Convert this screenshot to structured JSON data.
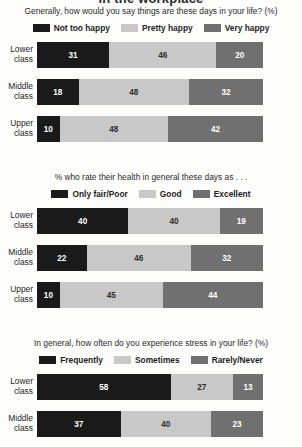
{
  "header": {
    "cut_title": "in the workplace"
  },
  "colors": {
    "cat1": "#1a1a1a",
    "cat2": "#c8c8c8",
    "cat3": "#707070",
    "background": "#fdfdfc",
    "text": "#1d1d1d"
  },
  "charts": [
    {
      "subtitle": "Generally, how would you say things are these days in your life? (%)",
      "legend": [
        "Not too happy",
        "Pretty happy",
        "Very happy"
      ],
      "rows": [
        {
          "label_line1": "Lower",
          "label_line2": "class",
          "values": [
            31,
            46,
            20
          ]
        },
        {
          "label_line1": "Middle",
          "label_line2": "class",
          "values": [
            18,
            48,
            32
          ]
        },
        {
          "label_line1": "Upper",
          "label_line2": "class",
          "values": [
            10,
            48,
            42
          ]
        }
      ]
    },
    {
      "subtitle": "% who rate their health in general these days as . . .",
      "legend": [
        "Only fair/Poor",
        "Good",
        "Excellent"
      ],
      "rows": [
        {
          "label_line1": "Lower",
          "label_line2": "class",
          "values": [
            40,
            40,
            19
          ]
        },
        {
          "label_line1": "Middle",
          "label_line2": "class",
          "values": [
            22,
            46,
            32
          ]
        },
        {
          "label_line1": "Upper",
          "label_line2": "class",
          "values": [
            10,
            45,
            44
          ]
        }
      ]
    },
    {
      "subtitle": "In general, how often do you experience stress in your life? (%)",
      "legend": [
        "Frequently",
        "Sometimes",
        "Rarely/Never"
      ],
      "rows": [
        {
          "label_line1": "Lower",
          "label_line2": "class",
          "values": [
            58,
            27,
            13
          ]
        },
        {
          "label_line1": "Middle",
          "label_line2": "class",
          "values": [
            37,
            40,
            23
          ]
        }
      ]
    }
  ],
  "chart_data": [
    {
      "type": "bar",
      "orientation": "horizontal",
      "stacked": true,
      "title": "Generally, how would you say things are these days in your life? (%)",
      "categories": [
        "Lower class",
        "Middle class",
        "Upper class"
      ],
      "series": [
        {
          "name": "Not too happy",
          "values": [
            31,
            18,
            10
          ],
          "color": "#1a1a1a"
        },
        {
          "name": "Pretty happy",
          "values": [
            46,
            48,
            48
          ],
          "color": "#c8c8c8"
        },
        {
          "name": "Very happy",
          "values": [
            20,
            32,
            42
          ],
          "color": "#707070"
        }
      ],
      "xlabel": "",
      "ylabel": "",
      "xlim": [
        0,
        100
      ],
      "grid": false,
      "legend_position": "top"
    },
    {
      "type": "bar",
      "orientation": "horizontal",
      "stacked": true,
      "title": "% who rate their health in general these days as . . .",
      "categories": [
        "Lower class",
        "Middle class",
        "Upper class"
      ],
      "series": [
        {
          "name": "Only fair/Poor",
          "values": [
            40,
            22,
            10
          ],
          "color": "#1a1a1a"
        },
        {
          "name": "Good",
          "values": [
            40,
            46,
            45
          ],
          "color": "#c8c8c8"
        },
        {
          "name": "Excellent",
          "values": [
            19,
            32,
            44
          ],
          "color": "#707070"
        }
      ],
      "xlabel": "",
      "ylabel": "",
      "xlim": [
        0,
        100
      ],
      "grid": false,
      "legend_position": "top"
    },
    {
      "type": "bar",
      "orientation": "horizontal",
      "stacked": true,
      "title": "In general, how often do you experience stress in your life? (%)",
      "categories": [
        "Lower class",
        "Middle class"
      ],
      "series": [
        {
          "name": "Frequently",
          "values": [
            58,
            37
          ],
          "color": "#1a1a1a"
        },
        {
          "name": "Sometimes",
          "values": [
            27,
            40
          ],
          "color": "#c8c8c8"
        },
        {
          "name": "Rarely/Never",
          "values": [
            13,
            23
          ],
          "color": "#707070"
        }
      ],
      "xlabel": "",
      "ylabel": "",
      "xlim": [
        0,
        100
      ],
      "grid": false,
      "legend_position": "top",
      "note": "Upper class row is cropped off the bottom of the image"
    }
  ]
}
